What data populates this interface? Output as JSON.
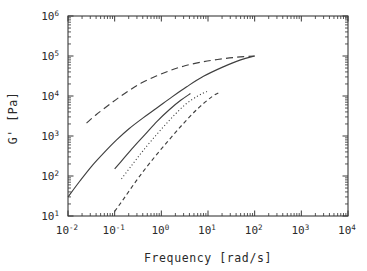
{
  "chart_data": {
    "type": "line",
    "title": "",
    "xlabel": "Frequency  [rad/s]",
    "ylabel": "G'  [Pa]",
    "xscale": "log",
    "yscale": "log",
    "xlim": [
      0.01,
      10000
    ],
    "ylim": [
      10,
      1000000
    ],
    "grid": false,
    "legend": "none",
    "xticklabels": [
      "10⁻²",
      "10⁻¹",
      "10⁰",
      "10¹",
      "10²",
      "10³",
      "10⁴"
    ],
    "xtick_mantissa": [
      "10",
      "10",
      "10",
      "10",
      "10",
      "10",
      "10"
    ],
    "xtick_exponents": [
      "-2",
      "-1",
      "0",
      "1",
      "2",
      "3",
      "4"
    ],
    "yticklabels": [
      "10¹",
      "10²",
      "10³",
      "10⁴",
      "10⁵",
      "10⁶"
    ],
    "ytick_mantissa": [
      "10",
      "10",
      "10",
      "10",
      "10",
      "10"
    ],
    "ytick_exponents": [
      "1",
      "2",
      "3",
      "4",
      "5",
      "6"
    ],
    "minor_ticks": true,
    "ticks_direction": "in",
    "ticks_all_sides": true,
    "series": [
      {
        "name": "curve-1-long-dash",
        "style": "long-dash",
        "x": [
          0.025,
          0.04,
          0.07,
          0.12,
          0.22,
          0.4,
          0.8,
          1.6,
          3.2,
          7.0,
          16.0,
          40.0,
          100.0
        ],
        "y": [
          2100,
          3400,
          5600,
          9000,
          14500,
          22000,
          32000,
          44000,
          57000,
          70000,
          82000,
          93000,
          100000
        ]
      },
      {
        "name": "curve-2-solid",
        "style": "solid",
        "x": [
          0.01,
          0.018,
          0.032,
          0.06,
          0.11,
          0.2,
          0.4,
          0.8,
          1.7,
          3.5,
          8.0,
          20.0,
          50.0,
          100.0
        ],
        "y": [
          30,
          75,
          175,
          390,
          800,
          1500,
          2800,
          5000,
          9500,
          17000,
          31000,
          52000,
          80000,
          100000
        ]
      },
      {
        "name": "curve-3-solid",
        "style": "solid",
        "x": [
          0.1,
          0.15,
          0.25,
          0.45,
          0.8,
          1.5,
          2.6,
          4.2
        ],
        "y": [
          150,
          260,
          520,
          1100,
          2300,
          4600,
          7800,
          11500
        ]
      },
      {
        "name": "curve-4-dotted",
        "style": "dotted",
        "x": [
          0.14,
          0.22,
          0.4,
          0.8,
          1.6,
          3.2,
          6.0,
          9.5
        ],
        "y": [
          85,
          170,
          420,
          1100,
          2700,
          6000,
          10000,
          13000
        ]
      },
      {
        "name": "curve-5-short-dash",
        "style": "short-dash",
        "x": [
          0.1,
          0.16,
          0.3,
          0.6,
          1.3,
          2.8,
          6.0,
          12.0,
          18.0
        ],
        "y": [
          13,
          28,
          80,
          230,
          680,
          1900,
          4800,
          9500,
          12500
        ]
      }
    ]
  },
  "axes": {
    "frame": {
      "left": 68,
      "right": 348,
      "top": 16,
      "bottom": 216
    }
  }
}
